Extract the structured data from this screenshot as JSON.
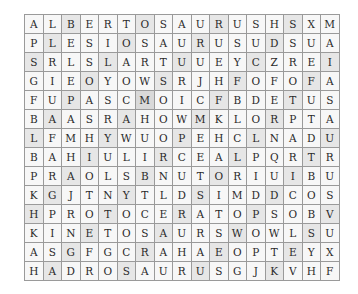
{
  "puzzle": {
    "type": "word-search",
    "columns": 17,
    "rows": 14,
    "grid": [
      [
        "A",
        "L",
        "B",
        "E",
        "R",
        "T",
        "O",
        "S",
        "A",
        "U",
        "R",
        "U",
        "S",
        "H",
        "S",
        "X",
        "M"
      ],
      [
        "P",
        "L",
        "E",
        "S",
        "I",
        "O",
        "S",
        "A",
        "U",
        "R",
        "U",
        "S",
        "U",
        "D",
        "S",
        "U",
        "A"
      ],
      [
        "S",
        "R",
        "L",
        "S",
        "L",
        "A",
        "R",
        "T",
        "U",
        "U",
        "E",
        "Y",
        "C",
        "Z",
        "R",
        "E",
        "I"
      ],
      [
        "G",
        "I",
        "E",
        "O",
        "Y",
        "O",
        "W",
        "S",
        "R",
        "J",
        "H",
        "F",
        "O",
        "F",
        "O",
        "F",
        "A"
      ],
      [
        "F",
        "U",
        "P",
        "A",
        "S",
        "C",
        "M",
        "O",
        "I",
        "C",
        "F",
        "B",
        "D",
        "E",
        "T",
        "U",
        "S"
      ],
      [
        "B",
        "A",
        "A",
        "S",
        "R",
        "A",
        "H",
        "O",
        "W",
        "M",
        "K",
        "L",
        "O",
        "R",
        "P",
        "T",
        "A"
      ],
      [
        "L",
        "F",
        "M",
        "H",
        "Y",
        "W",
        "U",
        "O",
        "P",
        "E",
        "H",
        "C",
        "L",
        "N",
        "A",
        "D",
        "U"
      ],
      [
        "B",
        "A",
        "H",
        "I",
        "U",
        "L",
        "I",
        "R",
        "C",
        "E",
        "A",
        "L",
        "P",
        "Q",
        "R",
        "T",
        "R"
      ],
      [
        "P",
        "R",
        "A",
        "O",
        "L",
        "S",
        "B",
        "N",
        "U",
        "T",
        "O",
        "R",
        "I",
        "U",
        "I",
        "B",
        "U"
      ],
      [
        "K",
        "G",
        "J",
        "T",
        "N",
        "Y",
        "T",
        "L",
        "D",
        "S",
        "I",
        "M",
        "D",
        "D",
        "C",
        "O",
        "S"
      ],
      [
        "H",
        "P",
        "R",
        "O",
        "T",
        "O",
        "C",
        "E",
        "R",
        "A",
        "T",
        "O",
        "P",
        "S",
        "O",
        "B",
        "V"
      ],
      [
        "K",
        "I",
        "N",
        "E",
        "T",
        "O",
        "S",
        "A",
        "U",
        "R",
        "S",
        "W",
        "O",
        "W",
        "L",
        "S",
        "U"
      ],
      [
        "A",
        "S",
        "G",
        "F",
        "G",
        "C",
        "R",
        "A",
        "H",
        "A",
        "E",
        "O",
        "P",
        "T",
        "E",
        "Y",
        "X"
      ],
      [
        "H",
        "A",
        "D",
        "R",
        "O",
        "S",
        "A",
        "U",
        "R",
        "U",
        "S",
        "G",
        "J",
        "K",
        "V",
        "H",
        "F"
      ]
    ],
    "shading": [
      [
        0,
        0,
        1,
        0,
        0,
        0,
        1,
        0,
        0,
        0,
        1,
        0,
        0,
        0,
        1,
        0,
        0
      ],
      [
        0,
        1,
        0,
        0,
        0,
        1,
        0,
        0,
        0,
        1,
        0,
        0,
        0,
        1,
        0,
        0,
        0
      ],
      [
        1,
        0,
        0,
        0,
        1,
        0,
        0,
        0,
        1,
        0,
        0,
        0,
        1,
        0,
        0,
        0,
        1
      ],
      [
        0,
        0,
        0,
        1,
        0,
        0,
        0,
        1,
        0,
        0,
        0,
        1,
        0,
        0,
        0,
        1,
        0
      ],
      [
        0,
        0,
        1,
        0,
        0,
        0,
        2,
        0,
        0,
        0,
        1,
        0,
        0,
        0,
        1,
        0,
        0
      ],
      [
        0,
        1,
        0,
        0,
        0,
        1,
        0,
        0,
        0,
        1,
        0,
        0,
        0,
        1,
        0,
        0,
        0
      ],
      [
        1,
        0,
        0,
        0,
        1,
        0,
        0,
        0,
        1,
        0,
        0,
        0,
        1,
        0,
        0,
        0,
        1
      ],
      [
        0,
        0,
        0,
        1,
        0,
        0,
        0,
        1,
        0,
        0,
        0,
        1,
        0,
        0,
        0,
        1,
        0
      ],
      [
        0,
        0,
        1,
        0,
        0,
        0,
        1,
        0,
        0,
        0,
        1,
        0,
        0,
        0,
        1,
        0,
        0
      ],
      [
        0,
        1,
        0,
        0,
        0,
        1,
        0,
        0,
        0,
        1,
        0,
        0,
        0,
        1,
        0,
        0,
        0
      ],
      [
        1,
        0,
        0,
        0,
        1,
        0,
        0,
        0,
        1,
        0,
        0,
        0,
        1,
        0,
        0,
        0,
        1
      ],
      [
        0,
        0,
        0,
        1,
        0,
        0,
        0,
        1,
        0,
        0,
        0,
        1,
        0,
        0,
        0,
        1,
        0
      ],
      [
        0,
        0,
        1,
        0,
        0,
        0,
        1,
        0,
        0,
        0,
        1,
        0,
        0,
        0,
        1,
        0,
        0
      ],
      [
        0,
        1,
        0,
        0,
        0,
        1,
        0,
        0,
        0,
        1,
        0,
        0,
        0,
        1,
        0,
        0,
        0
      ]
    ]
  }
}
